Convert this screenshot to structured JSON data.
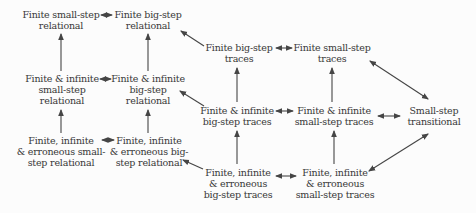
{
  "diagram_title": "Relations between semantics styles",
  "colors": {
    "background": "#fcfcfc",
    "text": "#383838",
    "arrow": "#454545"
  },
  "nodes": {
    "finite_small_step_relational": {
      "lines": [
        "Finite small-step",
        "relational"
      ]
    },
    "finite_big_step_relational": {
      "lines": [
        "Finite big-step",
        "relational"
      ]
    },
    "finite_infinite_small_step_relational": {
      "lines": [
        "Finite & infinite",
        "small-step",
        "relational"
      ]
    },
    "finite_infinite_big_step_relational": {
      "lines": [
        "Finite & infinite",
        "big-step",
        "relational"
      ]
    },
    "finite_infinite_erroneous_small_step_relational": {
      "lines": [
        "Finite, infinite",
        "& erroneous small-",
        "step relational"
      ]
    },
    "finite_infinite_erroneous_big_step_relational": {
      "lines": [
        "Finite, infinite",
        "& erroneous big-",
        "step relational"
      ]
    },
    "finite_big_step_traces": {
      "lines": [
        "Finite big-step",
        "traces"
      ]
    },
    "finite_small_step_traces": {
      "lines": [
        "Finite small-step",
        "traces"
      ]
    },
    "finite_infinite_big_step_traces": {
      "lines": [
        "Finite & infinite",
        "big-step traces"
      ]
    },
    "finite_infinite_small_step_traces": {
      "lines": [
        "Finite & infinite",
        "small-step traces"
      ]
    },
    "finite_infinite_erroneous_big_step_traces": {
      "lines": [
        "Finite, infinite",
        "& erroneous",
        "big-step traces"
      ]
    },
    "finite_infinite_erroneous_small_step_traces": {
      "lines": [
        "Finite, infinite",
        "& erroneous",
        "small-step traces"
      ]
    },
    "small_step_transitional": {
      "lines": [
        "Small-step",
        "transitional"
      ]
    }
  },
  "edges": [
    {
      "from": "finite_small_step_relational",
      "to": "finite_big_step_relational",
      "type": "bidirectional"
    },
    {
      "from": "finite_infinite_small_step_relational",
      "to": "finite_infinite_big_step_relational",
      "type": "bidirectional"
    },
    {
      "from": "finite_infinite_erroneous_small_step_relational",
      "to": "finite_infinite_erroneous_big_step_relational",
      "type": "bidirectional"
    },
    {
      "from": "finite_big_step_traces",
      "to": "finite_small_step_traces",
      "type": "bidirectional"
    },
    {
      "from": "finite_infinite_big_step_traces",
      "to": "finite_infinite_small_step_traces",
      "type": "bidirectional"
    },
    {
      "from": "finite_infinite_erroneous_big_step_traces",
      "to": "finite_infinite_erroneous_small_step_traces",
      "type": "bidirectional"
    },
    {
      "from": "finite_infinite_small_step_traces",
      "to": "small_step_transitional",
      "type": "bidirectional"
    },
    {
      "from": "finite_small_step_traces",
      "to": "small_step_transitional",
      "type": "bidirectional"
    },
    {
      "from": "finite_infinite_erroneous_small_step_traces",
      "to": "small_step_transitional",
      "type": "bidirectional"
    },
    {
      "from": "finite_infinite_small_step_relational",
      "to": "finite_small_step_relational",
      "type": "arrow"
    },
    {
      "from": "finite_infinite_big_step_relational",
      "to": "finite_big_step_relational",
      "type": "arrow"
    },
    {
      "from": "finite_infinite_erroneous_small_step_relational",
      "to": "finite_infinite_small_step_relational",
      "type": "arrow"
    },
    {
      "from": "finite_infinite_erroneous_big_step_relational",
      "to": "finite_infinite_big_step_relational",
      "type": "arrow"
    },
    {
      "from": "finite_infinite_big_step_traces",
      "to": "finite_big_step_traces",
      "type": "arrow"
    },
    {
      "from": "finite_infinite_small_step_traces",
      "to": "finite_small_step_traces",
      "type": "arrow"
    },
    {
      "from": "finite_infinite_erroneous_big_step_traces",
      "to": "finite_infinite_big_step_traces",
      "type": "arrow"
    },
    {
      "from": "finite_infinite_erroneous_small_step_traces",
      "to": "finite_infinite_small_step_traces",
      "type": "arrow"
    },
    {
      "from": "finite_big_step_traces",
      "to": "finite_big_step_relational",
      "type": "arrow"
    },
    {
      "from": "finite_infinite_big_step_traces",
      "to": "finite_infinite_big_step_relational",
      "type": "arrow"
    },
    {
      "from": "finite_infinite_erroneous_big_step_traces",
      "to": "finite_infinite_erroneous_big_step_relational",
      "type": "arrow"
    }
  ]
}
